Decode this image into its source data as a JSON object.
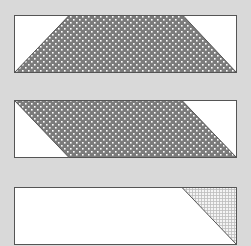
{
  "figure": {
    "colors": {
      "background": "#d9d9d9",
      "rect_fill": "#ffffff",
      "outline": "#555555",
      "dot_fill_base": "#7b7b7b",
      "dot_color": "#ffffff",
      "grid_line": "#bdbdbd"
    },
    "panels": [
      {
        "id": "trapezoid",
        "shape": "trapezoid",
        "pattern": "dots"
      },
      {
        "id": "parallelogram",
        "shape": "parallelogram",
        "pattern": "dots"
      },
      {
        "id": "triangle",
        "shape": "right-triangle",
        "pattern": "grid"
      }
    ]
  }
}
